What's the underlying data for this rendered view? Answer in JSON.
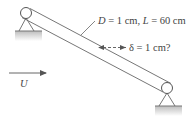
{
  "diagram": {
    "dimensions_label": {
      "D_symbol": "D",
      "D_value": " = 1 cm,  ",
      "L_symbol": "L",
      "L_value": " = 60 cm"
    },
    "deflection_label": {
      "symbol": "δ",
      "value": " = 1 cm?"
    },
    "flow_label": "U",
    "colors": {
      "line": "#555555",
      "ground": "#c8c8c8",
      "text": "#444444"
    }
  }
}
